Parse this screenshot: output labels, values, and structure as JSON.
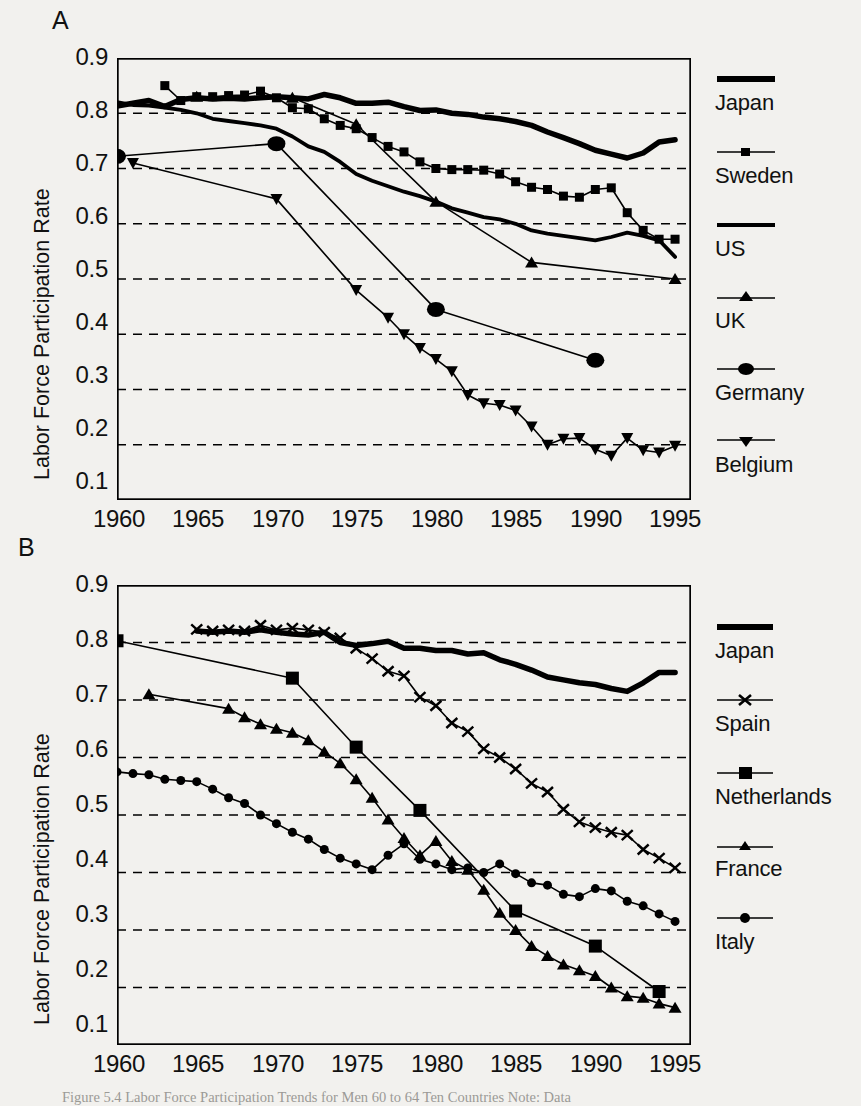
{
  "figure": {
    "caption": "Figure 5.4  Labor Force Participation Trends for Men 60 to 64 Ten Countries  Note: Data"
  },
  "panels": [
    {
      "letter": "A",
      "axis": {
        "ylabel": "Labor Force Participation Rate",
        "yticks": [
          "0.9",
          "0.8",
          "0.7",
          "0.6",
          "0.5",
          "0.4",
          "0.3",
          "0.2",
          "0.1"
        ],
        "xticks": [
          "1960",
          "1965",
          "1970",
          "1975",
          "1980",
          "1985",
          "1990",
          "1995"
        ]
      },
      "legend": [
        {
          "label": "Japan",
          "marker": "none"
        },
        {
          "label": "Sweden",
          "marker": "square-small"
        },
        {
          "label": "US",
          "marker": "none"
        },
        {
          "label": "UK",
          "marker": "triangle-up"
        },
        {
          "label": "Germany",
          "marker": "circle"
        },
        {
          "label": "Belgium",
          "marker": "triangle-down"
        }
      ]
    },
    {
      "letter": "B",
      "axis": {
        "ylabel": "Labor Force Participation Rate",
        "yticks": [
          "0.9",
          "0.8",
          "0.7",
          "0.6",
          "0.5",
          "0.4",
          "0.3",
          "0.2",
          "0.1"
        ],
        "xticks": [
          "1960",
          "1965",
          "1970",
          "1975",
          "1980",
          "1985",
          "1990",
          "1995"
        ]
      },
      "legend": [
        {
          "label": "Japan",
          "marker": "none"
        },
        {
          "label": "Spain",
          "marker": "x"
        },
        {
          "label": "Netherlands",
          "marker": "square-big"
        },
        {
          "label": "France",
          "marker": "triangle-up"
        },
        {
          "label": "Italy",
          "marker": "circle-small"
        }
      ]
    }
  ],
  "chart_data": [
    {
      "type": "line",
      "panel": "A",
      "title": "",
      "xlabel": "",
      "ylabel": "Labor Force Participation Rate",
      "xlim": [
        1960,
        1996
      ],
      "ylim": [
        0.1,
        0.9
      ],
      "xticks": [
        1960,
        1965,
        1970,
        1975,
        1980,
        1985,
        1990,
        1995
      ],
      "yticks": [
        0.1,
        0.2,
        0.3,
        0.4,
        0.5,
        0.6,
        0.7,
        0.8,
        0.9
      ],
      "grid": "horizontal-dashed",
      "legend_position": "right",
      "series": [
        {
          "name": "Japan",
          "style": "thick-line",
          "marker": "none",
          "x": [
            1960,
            1961,
            1962,
            1963,
            1964,
            1965,
            1966,
            1967,
            1968,
            1969,
            1970,
            1971,
            1972,
            1973,
            1974,
            1975,
            1976,
            1977,
            1978,
            1979,
            1980,
            1981,
            1982,
            1983,
            1984,
            1985,
            1986,
            1987,
            1988,
            1989,
            1990,
            1991,
            1992,
            1993,
            1994,
            1995
          ],
          "y": [
            0.813,
            0.818,
            0.823,
            0.812,
            0.825,
            0.828,
            0.826,
            0.827,
            0.826,
            0.828,
            0.83,
            0.828,
            0.826,
            0.834,
            0.828,
            0.818,
            0.818,
            0.82,
            0.812,
            0.805,
            0.806,
            0.8,
            0.798,
            0.793,
            0.79,
            0.785,
            0.778,
            0.766,
            0.756,
            0.745,
            0.733,
            0.726,
            0.719,
            0.728,
            0.748,
            0.752
          ]
        },
        {
          "name": "Sweden",
          "style": "thin-line",
          "marker": "square-small",
          "x": [
            1963,
            1964,
            1965,
            1966,
            1967,
            1968,
            1969,
            1970,
            1971,
            1972,
            1973,
            1974,
            1975,
            1976,
            1977,
            1978,
            1979,
            1980,
            1981,
            1982,
            1983,
            1984,
            1985,
            1986,
            1987,
            1988,
            1989,
            1990,
            1991,
            1992,
            1993,
            1994,
            1995
          ],
          "y": [
            0.85,
            0.823,
            0.83,
            0.83,
            0.832,
            0.833,
            0.84,
            0.828,
            0.81,
            0.808,
            0.79,
            0.778,
            0.772,
            0.756,
            0.74,
            0.73,
            0.712,
            0.7,
            0.698,
            0.698,
            0.697,
            0.69,
            0.676,
            0.666,
            0.662,
            0.65,
            0.648,
            0.662,
            0.665,
            0.62,
            0.588,
            0.572,
            0.572
          ]
        },
        {
          "name": "US",
          "style": "medium-line",
          "marker": "none",
          "x": [
            1960,
            1961,
            1962,
            1963,
            1964,
            1965,
            1966,
            1967,
            1968,
            1969,
            1970,
            1971,
            1972,
            1973,
            1974,
            1975,
            1976,
            1977,
            1978,
            1979,
            1980,
            1981,
            1982,
            1983,
            1984,
            1985,
            1986,
            1987,
            1988,
            1989,
            1990,
            1991,
            1992,
            1993,
            1994,
            1995
          ],
          "y": [
            0.82,
            0.815,
            0.814,
            0.81,
            0.806,
            0.8,
            0.79,
            0.786,
            0.782,
            0.778,
            0.772,
            0.758,
            0.74,
            0.73,
            0.712,
            0.69,
            0.678,
            0.668,
            0.658,
            0.65,
            0.64,
            0.628,
            0.62,
            0.612,
            0.608,
            0.6,
            0.588,
            0.582,
            0.578,
            0.574,
            0.57,
            0.576,
            0.584,
            0.578,
            0.57,
            0.54
          ]
        },
        {
          "name": "UK",
          "style": "thin-line",
          "marker": "triangle-up",
          "x": [
            1965,
            1971,
            1975,
            1980,
            1986,
            1995
          ],
          "y": [
            0.83,
            0.828,
            0.78,
            0.64,
            0.53,
            0.5
          ]
        },
        {
          "name": "Germany",
          "style": "thin-line",
          "marker": "circle",
          "x": [
            1960,
            1970,
            1980,
            1990
          ],
          "y": [
            0.722,
            0.745,
            0.445,
            0.353
          ]
        },
        {
          "name": "Belgium",
          "style": "thin-line",
          "marker": "triangle-down",
          "x": [
            1961,
            1970,
            1975,
            1977,
            1978,
            1979,
            1980,
            1981,
            1982,
            1983,
            1984,
            1985,
            1986,
            1987,
            1988,
            1989,
            1990,
            1991,
            1992,
            1993,
            1994,
            1995
          ],
          "y": [
            0.71,
            0.645,
            0.48,
            0.43,
            0.4,
            0.375,
            0.355,
            0.333,
            0.29,
            0.275,
            0.272,
            0.262,
            0.233,
            0.2,
            0.211,
            0.212,
            0.192,
            0.18,
            0.212,
            0.19,
            0.186,
            0.198
          ]
        }
      ]
    },
    {
      "type": "line",
      "panel": "B",
      "title": "",
      "xlabel": "",
      "ylabel": "Labor Force Participation Rate",
      "xlim": [
        1960,
        1996
      ],
      "ylim": [
        0.1,
        0.9
      ],
      "xticks": [
        1960,
        1965,
        1970,
        1975,
        1980,
        1985,
        1990,
        1995
      ],
      "yticks": [
        0.1,
        0.2,
        0.3,
        0.4,
        0.5,
        0.6,
        0.7,
        0.8,
        0.9
      ],
      "grid": "horizontal-dashed",
      "legend_position": "right",
      "series": [
        {
          "name": "Japan",
          "style": "thick-line",
          "marker": "none",
          "x": [
            1965,
            1966,
            1967,
            1968,
            1969,
            1970,
            1971,
            1972,
            1973,
            1974,
            1975,
            1976,
            1977,
            1978,
            1979,
            1980,
            1981,
            1982,
            1983,
            1984,
            1985,
            1986,
            1987,
            1988,
            1989,
            1990,
            1991,
            1992,
            1993,
            1994,
            1995
          ],
          "y": [
            0.82,
            0.818,
            0.82,
            0.818,
            0.822,
            0.818,
            0.815,
            0.813,
            0.818,
            0.8,
            0.795,
            0.798,
            0.802,
            0.79,
            0.79,
            0.786,
            0.786,
            0.78,
            0.782,
            0.77,
            0.762,
            0.752,
            0.74,
            0.735,
            0.73,
            0.727,
            0.72,
            0.715,
            0.73,
            0.748,
            0.748
          ]
        },
        {
          "name": "Spain",
          "style": "thin-line",
          "marker": "x",
          "x": [
            1965,
            1966,
            1967,
            1968,
            1969,
            1970,
            1971,
            1972,
            1973,
            1974,
            1975,
            1976,
            1977,
            1978,
            1979,
            1980,
            1981,
            1982,
            1983,
            1984,
            1985,
            1986,
            1987,
            1988,
            1989,
            1990,
            1991,
            1992,
            1993,
            1994,
            1995
          ],
          "y": [
            0.823,
            0.82,
            0.822,
            0.82,
            0.83,
            0.822,
            0.825,
            0.822,
            0.818,
            0.808,
            0.79,
            0.772,
            0.75,
            0.742,
            0.705,
            0.69,
            0.66,
            0.645,
            0.615,
            0.6,
            0.58,
            0.555,
            0.54,
            0.51,
            0.488,
            0.478,
            0.47,
            0.465,
            0.44,
            0.425,
            0.408
          ]
        },
        {
          "name": "Netherlands",
          "style": "thin-line",
          "marker": "square-big",
          "x": [
            1960,
            1971,
            1975,
            1979,
            1985,
            1990,
            1994
          ],
          "y": [
            0.803,
            0.738,
            0.618,
            0.508,
            0.333,
            0.272,
            0.193
          ]
        },
        {
          "name": "France",
          "style": "thin-line",
          "marker": "triangle-up",
          "x": [
            1962,
            1967,
            1968,
            1969,
            1970,
            1971,
            1972,
            1973,
            1974,
            1975,
            1976,
            1977,
            1978,
            1979,
            1980,
            1981,
            1982,
            1983,
            1984,
            1985,
            1986,
            1987,
            1988,
            1989,
            1990,
            1991,
            1992,
            1993,
            1994,
            1995
          ],
          "y": [
            0.71,
            0.685,
            0.67,
            0.658,
            0.65,
            0.643,
            0.63,
            0.61,
            0.59,
            0.562,
            0.53,
            0.492,
            0.46,
            0.43,
            0.455,
            0.42,
            0.405,
            0.37,
            0.33,
            0.3,
            0.272,
            0.255,
            0.24,
            0.23,
            0.22,
            0.2,
            0.185,
            0.182,
            0.172,
            0.165
          ]
        },
        {
          "name": "Italy",
          "style": "thin-line",
          "marker": "circle-small",
          "x": [
            1960,
            1961,
            1962,
            1963,
            1964,
            1965,
            1966,
            1967,
            1968,
            1969,
            1970,
            1971,
            1972,
            1973,
            1974,
            1975,
            1976,
            1977,
            1978,
            1979,
            1980,
            1981,
            1982,
            1983,
            1984,
            1985,
            1986,
            1987,
            1988,
            1989,
            1990,
            1991,
            1992,
            1993,
            1994,
            1995
          ],
          "y": [
            0.575,
            0.572,
            0.57,
            0.562,
            0.56,
            0.558,
            0.545,
            0.53,
            0.52,
            0.5,
            0.485,
            0.47,
            0.458,
            0.44,
            0.425,
            0.415,
            0.405,
            0.43,
            0.45,
            0.423,
            0.415,
            0.405,
            0.408,
            0.4,
            0.415,
            0.398,
            0.382,
            0.378,
            0.362,
            0.358,
            0.372,
            0.368,
            0.35,
            0.342,
            0.328,
            0.315
          ]
        }
      ]
    }
  ]
}
